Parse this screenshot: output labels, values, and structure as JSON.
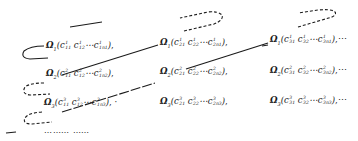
{
  "diagram": {
    "rows": [
      {
        "symbol": "Ω",
        "index": "1",
        "cells": [
          {
            "sup": "1",
            "subs": [
              "11",
              "12",
              "1n"
            ],
            "n_sub": "1",
            "suffix": ","
          },
          {
            "sup": "1",
            "subs": [
              "21",
              "22",
              "2n"
            ],
            "n_sub": "1",
            "suffix": ","
          },
          {
            "sup": "1",
            "subs": [
              "31",
              "32",
              "3n"
            ],
            "n_sub": "1",
            "suffix": ",⋯"
          }
        ]
      },
      {
        "symbol": "Ω",
        "index": "2",
        "cells": [
          {
            "sup": "2",
            "subs": [
              "11",
              "12",
              "1n"
            ],
            "n_sub": "2",
            "suffix": ","
          },
          {
            "sup": "2",
            "subs": [
              "21",
              "22",
              "2n"
            ],
            "n_sub": "2",
            "suffix": ","
          },
          {
            "sup": "2",
            "subs": [
              "31",
              "32",
              "3n"
            ],
            "n_sub": "2",
            "suffix": ",⋯"
          }
        ]
      },
      {
        "symbol": "Ω",
        "index": "3",
        "cells": [
          {
            "sup": "3",
            "subs": [
              "11",
              "12",
              "1n"
            ],
            "n_sub": "3",
            "suffix": ", ·"
          },
          {
            "sup": "3",
            "subs": [
              "21",
              "22",
              "2n"
            ],
            "n_sub": "3",
            "suffix": ","
          },
          {
            "sup": "3",
            "subs": [
              "31",
              "32",
              "3n"
            ],
            "n_sub": "3",
            "suffix": ",⋯"
          }
        ]
      }
    ],
    "continuation": "⋯⋯⋯ ⋯⋯",
    "line_color": "#1a1a1a"
  }
}
